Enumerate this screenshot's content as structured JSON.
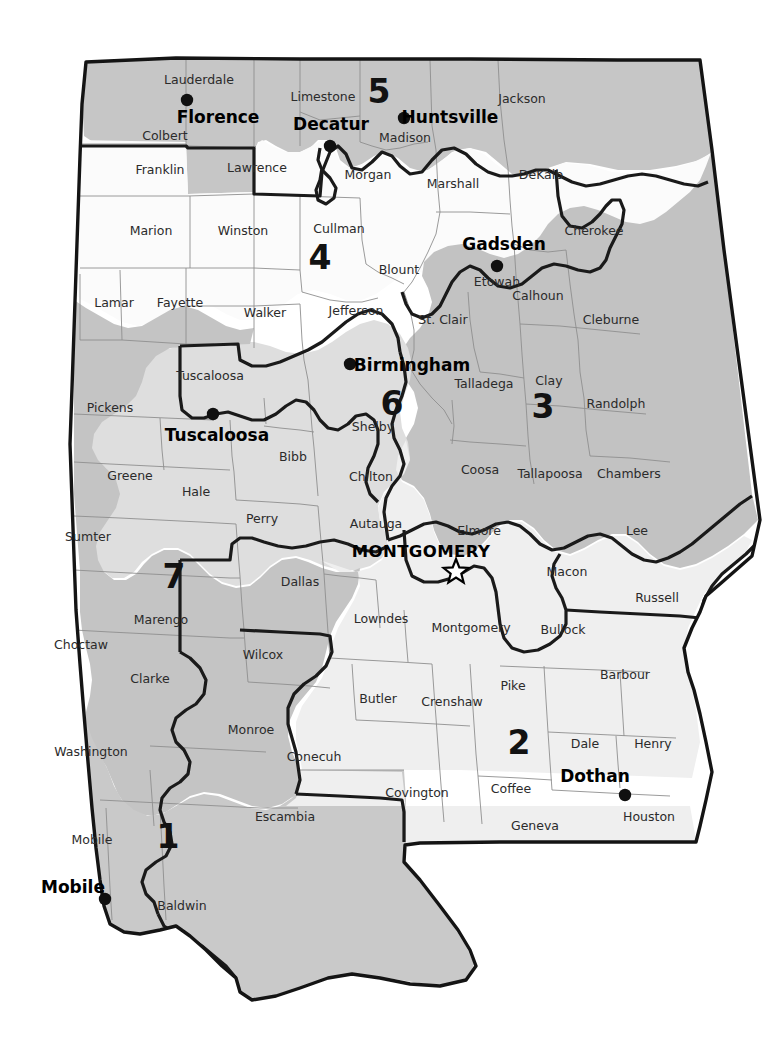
{
  "map": {
    "title": "Alabama Congressional Districts",
    "state": "Alabama",
    "background_color": "#ffffff",
    "district_fills": {
      "1": "#c9c9c9",
      "2": "#efefef",
      "3": "#c2c2c2",
      "4": "#fbfbfb",
      "5": "#c6c6c6",
      "6": "#dedede",
      "7": "#c4c4c4"
    },
    "outline_color": "#141414",
    "county_border_color": "#8e8e8e"
  },
  "districts": [
    {
      "number": "1",
      "label_x": 168,
      "label_y": 838
    },
    {
      "number": "2",
      "label_x": 519,
      "label_y": 744
    },
    {
      "number": "3",
      "label_x": 543,
      "label_y": 408
    },
    {
      "number": "4",
      "label_x": 320,
      "label_y": 259
    },
    {
      "number": "5",
      "label_x": 379,
      "label_y": 93
    },
    {
      "number": "6",
      "label_x": 392,
      "label_y": 405
    },
    {
      "number": "7",
      "label_x": 174,
      "label_y": 578
    }
  ],
  "cities": [
    {
      "name": "Florence",
      "label_x": 218,
      "label_y": 118,
      "dot_x": 187,
      "dot_y": 100
    },
    {
      "name": "Decatur",
      "label_x": 331,
      "label_y": 125,
      "dot_x": 330,
      "dot_y": 146
    },
    {
      "name": "Huntsville",
      "label_x": 450,
      "label_y": 118,
      "dot_x": 404,
      "dot_y": 118
    },
    {
      "name": "Gadsden",
      "label_x": 504,
      "label_y": 245,
      "dot_x": 497,
      "dot_y": 266
    },
    {
      "name": "Birmingham",
      "label_x": 412,
      "label_y": 366,
      "dot_x": 350,
      "dot_y": 364
    },
    {
      "name": "Tuscaloosa",
      "label_x": 217,
      "label_y": 436,
      "dot_x": 213,
      "dot_y": 414
    },
    {
      "name": "Dothan",
      "label_x": 595,
      "label_y": 777,
      "dot_x": 625,
      "dot_y": 795
    },
    {
      "name": "Mobile",
      "label_x": 73,
      "label_y": 888,
      "dot_x": 105,
      "dot_y": 899
    }
  ],
  "capital": {
    "name": "MONTGOMERY",
    "label_x": 421,
    "label_y": 552,
    "star_x": 456,
    "star_y": 572
  },
  "counties": [
    {
      "name": "Lauderdale",
      "x": 199,
      "y": 80
    },
    {
      "name": "Limestone",
      "x": 323,
      "y": 97
    },
    {
      "name": "Jackson",
      "x": 522,
      "y": 99
    },
    {
      "name": "Colbert",
      "x": 165,
      "y": 136
    },
    {
      "name": "Madison",
      "x": 405,
      "y": 138
    },
    {
      "name": "Franklin",
      "x": 160,
      "y": 170
    },
    {
      "name": "Lawrence",
      "x": 257,
      "y": 168
    },
    {
      "name": "Morgan",
      "x": 368,
      "y": 175
    },
    {
      "name": "Marshall",
      "x": 453,
      "y": 184
    },
    {
      "name": "DeKalb",
      "x": 541,
      "y": 175
    },
    {
      "name": "Marion",
      "x": 151,
      "y": 231
    },
    {
      "name": "Winston",
      "x": 243,
      "y": 231
    },
    {
      "name": "Cullman",
      "x": 339,
      "y": 229
    },
    {
      "name": "Cherokee",
      "x": 594,
      "y": 231
    },
    {
      "name": "Blount",
      "x": 399,
      "y": 270
    },
    {
      "name": "Etowah",
      "x": 497,
      "y": 282
    },
    {
      "name": "Lamar",
      "x": 114,
      "y": 303
    },
    {
      "name": "Fayette",
      "x": 180,
      "y": 303
    },
    {
      "name": "Walker",
      "x": 265,
      "y": 313
    },
    {
      "name": "Jefferson",
      "x": 356,
      "y": 311
    },
    {
      "name": "St. Clair",
      "x": 443,
      "y": 320
    },
    {
      "name": "Calhoun",
      "x": 538,
      "y": 296
    },
    {
      "name": "Cleburne",
      "x": 611,
      "y": 320
    },
    {
      "name": "Tuscaloosa",
      "x": 210,
      "y": 376
    },
    {
      "name": "Talladega",
      "x": 484,
      "y": 384
    },
    {
      "name": "Clay",
      "x": 549,
      "y": 381
    },
    {
      "name": "Pickens",
      "x": 110,
      "y": 408
    },
    {
      "name": "Shelby",
      "x": 373,
      "y": 427
    },
    {
      "name": "Randolph",
      "x": 616,
      "y": 404
    },
    {
      "name": "Bibb",
      "x": 293,
      "y": 457
    },
    {
      "name": "Chilton",
      "x": 371,
      "y": 477
    },
    {
      "name": "Coosa",
      "x": 480,
      "y": 470
    },
    {
      "name": "Tallapoosa",
      "x": 550,
      "y": 474
    },
    {
      "name": "Chambers",
      "x": 629,
      "y": 474
    },
    {
      "name": "Greene",
      "x": 130,
      "y": 476
    },
    {
      "name": "Hale",
      "x": 196,
      "y": 492
    },
    {
      "name": "Sumter",
      "x": 88,
      "y": 537
    },
    {
      "name": "Perry",
      "x": 262,
      "y": 519
    },
    {
      "name": "Autauga",
      "x": 376,
      "y": 524
    },
    {
      "name": "Elmore",
      "x": 479,
      "y": 531
    },
    {
      "name": "Lee",
      "x": 637,
      "y": 531
    },
    {
      "name": "Dallas",
      "x": 300,
      "y": 582
    },
    {
      "name": "Macon",
      "x": 567,
      "y": 572
    },
    {
      "name": "Marengo",
      "x": 161,
      "y": 620
    },
    {
      "name": "Wilcox",
      "x": 263,
      "y": 655
    },
    {
      "name": "Lowndes",
      "x": 381,
      "y": 619
    },
    {
      "name": "Montgomery",
      "x": 471,
      "y": 628
    },
    {
      "name": "Bullock",
      "x": 563,
      "y": 630
    },
    {
      "name": "Russell",
      "x": 657,
      "y": 598
    },
    {
      "name": "Choctaw",
      "x": 81,
      "y": 645
    },
    {
      "name": "Clarke",
      "x": 150,
      "y": 679
    },
    {
      "name": "Monroe",
      "x": 251,
      "y": 730
    },
    {
      "name": "Butler",
      "x": 378,
      "y": 699
    },
    {
      "name": "Crenshaw",
      "x": 452,
      "y": 702
    },
    {
      "name": "Pike",
      "x": 513,
      "y": 686
    },
    {
      "name": "Barbour",
      "x": 625,
      "y": 675
    },
    {
      "name": "Washington",
      "x": 91,
      "y": 752
    },
    {
      "name": "Conecuh",
      "x": 314,
      "y": 757
    },
    {
      "name": "Dale",
      "x": 585,
      "y": 744
    },
    {
      "name": "Henry",
      "x": 653,
      "y": 744
    },
    {
      "name": "Escambia",
      "x": 285,
      "y": 817
    },
    {
      "name": "Covington",
      "x": 417,
      "y": 793
    },
    {
      "name": "Coffee",
      "x": 511,
      "y": 789
    },
    {
      "name": "Geneva",
      "x": 535,
      "y": 826
    },
    {
      "name": "Houston",
      "x": 649,
      "y": 817
    },
    {
      "name": "Mobile",
      "x": 92,
      "y": 840
    },
    {
      "name": "Baldwin",
      "x": 182,
      "y": 906
    }
  ]
}
